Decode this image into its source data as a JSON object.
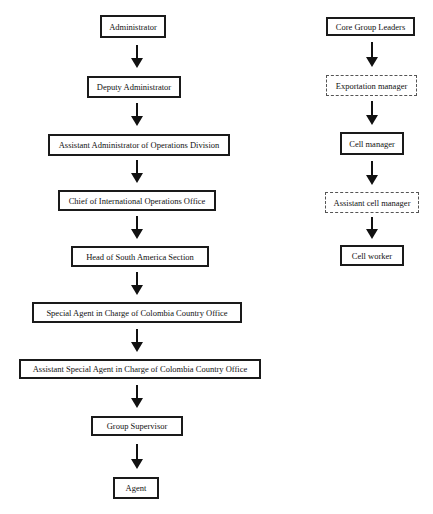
{
  "left_chain": {
    "nodes": [
      {
        "label": "Administrator",
        "style": "solid"
      },
      {
        "label": "Deputy Administrator",
        "style": "solid"
      },
      {
        "label": "Assistant Administrator of Operations Division",
        "style": "solid"
      },
      {
        "label": "Chief of International Operations Office",
        "style": "solid"
      },
      {
        "label": "Head of South America Section",
        "style": "solid"
      },
      {
        "label": "Special Agent in Charge of Colombia Country Office",
        "style": "solid"
      },
      {
        "label": "Assistant Special Agent in Charge of Colombia Country Office",
        "style": "solid"
      },
      {
        "label": "Group Supervisor",
        "style": "solid"
      },
      {
        "label": "Agent",
        "style": "solid"
      }
    ]
  },
  "right_chain": {
    "nodes": [
      {
        "label": "Core Group Leaders",
        "style": "solid"
      },
      {
        "label": "Exportation manager",
        "style": "dashed"
      },
      {
        "label": "Cell manager",
        "style": "solid"
      },
      {
        "label": "Assistant cell manager",
        "style": "dashed"
      },
      {
        "label": "Cell worker",
        "style": "solid"
      }
    ]
  },
  "edges": {
    "arrow_direction": "down",
    "left": [
      [
        "Administrator",
        "Deputy Administrator"
      ],
      [
        "Deputy Administrator",
        "Assistant Administrator of Operations Division"
      ],
      [
        "Assistant Administrator of Operations Division",
        "Chief of International Operations Office"
      ],
      [
        "Chief of International Operations Office",
        "Head of South America Section"
      ],
      [
        "Head of South America Section",
        "Special Agent in Charge of Colombia Country Office"
      ],
      [
        "Special Agent in Charge of Colombia Country Office",
        "Assistant Special Agent in Charge of Colombia Country Office"
      ],
      [
        "Assistant Special Agent in Charge of Colombia Country Office",
        "Group Supervisor"
      ],
      [
        "Group Supervisor",
        "Agent"
      ]
    ],
    "right": [
      [
        "Core Group Leaders",
        "Exportation manager"
      ],
      [
        "Exportation manager",
        "Cell manager"
      ],
      [
        "Cell manager",
        "Assistant cell manager"
      ],
      [
        "Assistant cell manager",
        "Cell worker"
      ]
    ]
  }
}
